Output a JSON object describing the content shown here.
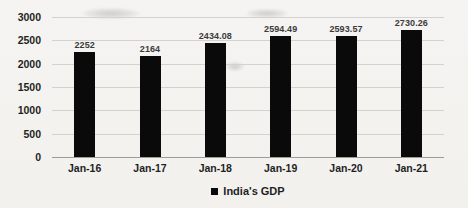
{
  "chart_data": {
    "type": "bar",
    "title": "",
    "xlabel": "",
    "ylabel": "",
    "categories": [
      "Jan-16",
      "Jan-17",
      "Jan-18",
      "Jan-19",
      "Jan-20",
      "Jan-21"
    ],
    "values": [
      2252,
      2164,
      2434.08,
      2594.49,
      2593.57,
      2730.26
    ],
    "data_labels": [
      "2252",
      "2164",
      "2434.08",
      "2594.49",
      "2593.57",
      "2730.26"
    ],
    "ylim": [
      0,
      3000
    ],
    "ytick_step": 500,
    "yticks": [
      "0",
      "500",
      "1000",
      "1500",
      "2000",
      "2500",
      "3000"
    ],
    "grid": true,
    "legend": {
      "label": "India's GDP",
      "position": "bottom",
      "marker": "black-square"
    },
    "colors": {
      "bar": "#0a0a0a",
      "gridline": "#d4d2ce",
      "axis_line": "#9e9c98",
      "tick_text": "#1f1f1f",
      "data_label_text": "#3b3b3b",
      "background": "#f3f2ef"
    }
  }
}
